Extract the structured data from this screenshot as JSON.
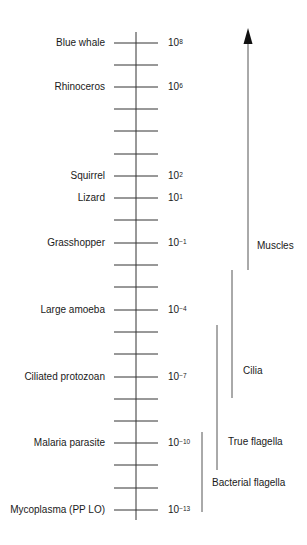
{
  "diagram": {
    "title": "",
    "scale": {
      "axis_label": "",
      "rungs_count": 22,
      "top_exponent": 8,
      "bottom_exponent": -13,
      "labeled_rows": [
        {
          "organism": "Blue whale",
          "base": "10",
          "exponent": "8"
        },
        {
          "organism": "Rhinoceros",
          "base": "10",
          "exponent": "6"
        },
        {
          "organism": "Squirrel",
          "base": "10",
          "exponent": "2"
        },
        {
          "organism": "Lizard",
          "base": "10",
          "exponent": "1"
        },
        {
          "organism": "Grasshopper",
          "base": "10",
          "exponent": "−1"
        },
        {
          "organism": "Large amoeba",
          "base": "10",
          "exponent": "−4"
        },
        {
          "organism": "Ciliated protozoan",
          "base": "10",
          "exponent": "−7"
        },
        {
          "organism": "Malaria parasite",
          "base": "10",
          "exponent": "−10"
        },
        {
          "organism": "Mycoplasma (PP LO)",
          "base": "10",
          "exponent": "−13"
        }
      ]
    },
    "motility_ranges": [
      {
        "label": "Muscles",
        "from_exponent": -2,
        "to_exponent": 8,
        "arrow": true
      },
      {
        "label": "Cilia",
        "from_exponent": -7.5,
        "to_exponent": -2
      },
      {
        "label": "True flagella",
        "from_exponent": -10.5,
        "to_exponent": -4.5
      },
      {
        "label": "Bacterial flagella",
        "from_exponent": -13,
        "to_exponent": -9.5
      }
    ],
    "colors": {
      "line": "#333333",
      "range_line": "#555555",
      "text": "#1a1a1a"
    }
  }
}
